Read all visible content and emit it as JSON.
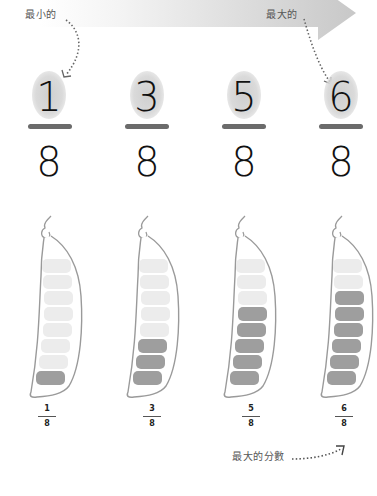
{
  "arrow": {
    "label_smallest": "最小的",
    "label_largest": "最大的",
    "gradient_start": "#ffffff",
    "gradient_end": "#c9c9c9"
  },
  "fractions": [
    {
      "numerator": "1",
      "denominator": "8",
      "filled": 1,
      "total": 8
    },
    {
      "numerator": "3",
      "denominator": "8",
      "filled": 3,
      "total": 8
    },
    {
      "numerator": "5",
      "denominator": "8",
      "filled": 5,
      "total": 8
    },
    {
      "numerator": "6",
      "denominator": "8",
      "filled": 6,
      "total": 8
    }
  ],
  "bottom_note": {
    "label": "最大的分數"
  },
  "colors": {
    "pea_filled": "#9e9e9e",
    "pea_empty": "#ececec",
    "pod_outline": "#9a9a9a",
    "fraction_bar": "#6b6b6b",
    "digit": "#111111"
  }
}
